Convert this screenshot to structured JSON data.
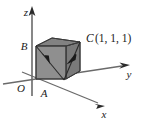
{
  "figure": {
    "axes": [
      {
        "name": "z-axis",
        "label": "z",
        "direction": "up"
      },
      {
        "name": "y-axis",
        "label": "y",
        "direction": "right"
      },
      {
        "name": "x-axis",
        "label": "x",
        "direction": "down-right"
      }
    ],
    "vertices": [
      {
        "name": "origin",
        "label": "O"
      },
      {
        "name": "vertex-a",
        "label": "A"
      },
      {
        "name": "vertex-b",
        "label": "B"
      },
      {
        "name": "vertex-c",
        "label": "C"
      }
    ],
    "annotations": [
      {
        "name": "point-c-coordinates",
        "label": "C",
        "coords": "(1, 1, 1)"
      }
    ],
    "colors": {
      "cube_front_face": "#8f8f8f",
      "cube_top_face": "#808080",
      "cube_right_face": "#7a7a7a",
      "cube_edge": "#3a3a3a",
      "axis_line": "#5a5a5a",
      "diagonal_vector": "#2b2b2b",
      "label_text": "#1a1a1a",
      "background": "#ffffff"
    }
  }
}
